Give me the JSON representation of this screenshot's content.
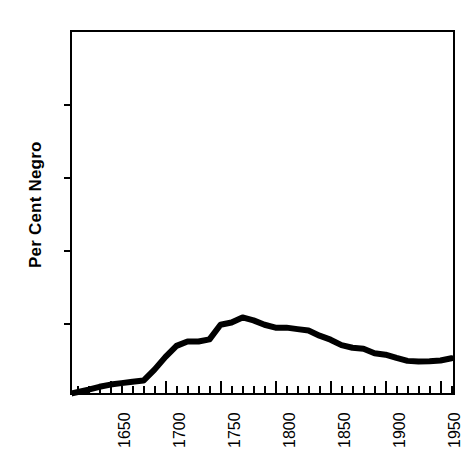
{
  "chart_data": {
    "type": "line",
    "title": "",
    "xlabel": "",
    "ylabel": "Per Cent Negro",
    "xlim": [
      1615,
      1965
    ],
    "ylim": [
      0,
      100
    ],
    "grid": false,
    "legend": false,
    "legend_position": "none",
    "y_ticks": [
      0,
      20,
      40,
      60,
      80,
      100
    ],
    "y_tick_labels": [
      "0",
      "20",
      "40",
      "60",
      "80",
      "100"
    ],
    "y_minor_tick_interval": 0,
    "x_ticks": [
      1650,
      1700,
      1750,
      1800,
      1850,
      1900,
      1950
    ],
    "x_tick_labels": [
      "1650",
      "1700",
      "1750",
      "1800",
      "1850",
      "1900",
      "1950"
    ],
    "x_minor_tick_interval": 10,
    "series": [
      {
        "name": "Per Cent Negro",
        "line_color": "#000000",
        "line_width": 6,
        "x": [
          1615,
          1630,
          1640,
          1650,
          1660,
          1670,
          1680,
          1690,
          1700,
          1710,
          1720,
          1730,
          1740,
          1750,
          1760,
          1770,
          1780,
          1790,
          1800,
          1810,
          1820,
          1830,
          1840,
          1850,
          1860,
          1870,
          1880,
          1890,
          1900,
          1910,
          1920,
          1930,
          1940,
          1950,
          1960
        ],
        "y": [
          1.0,
          2.0,
          2.8,
          3.4,
          3.8,
          4.2,
          4.5,
          7.5,
          11.0,
          14.0,
          15.2,
          15.2,
          15.8,
          19.8,
          20.4,
          21.8,
          21.0,
          19.8,
          19.0,
          19.0,
          18.6,
          18.2,
          16.8,
          15.7,
          14.2,
          13.5,
          13.2,
          12.0,
          11.6,
          10.7,
          9.9,
          9.7,
          9.8,
          10.0,
          10.6
        ]
      }
    ]
  }
}
